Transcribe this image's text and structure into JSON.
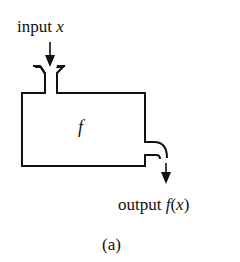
{
  "diagram": {
    "input": {
      "word": "input",
      "var": "x"
    },
    "function": {
      "name": "f"
    },
    "output": {
      "word": "output",
      "expr_f": "f",
      "expr_open": "(",
      "expr_var": "x",
      "expr_close": ")"
    },
    "caption": "(a)"
  },
  "colors": {
    "stroke": "#111111",
    "background": "#ffffff"
  }
}
